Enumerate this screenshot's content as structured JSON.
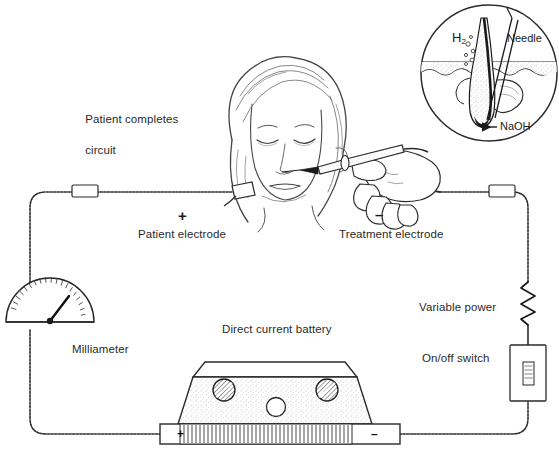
{
  "figure": {
    "background_color": "#ffffff",
    "line_color": "#1a1a1a",
    "text_color": "#2a2a2a"
  },
  "labels": {
    "patient_completes_circuit_line1": "Patient completes",
    "patient_completes_circuit_line2": "circuit",
    "patient_electrode": "Patient electrode",
    "patient_electrode_polarity": "+",
    "treatment_electrode": "Treatment electrode",
    "treatment_electrode_polarity": "–",
    "milliameter": "Milliameter",
    "direct_current_battery": "Direct current battery",
    "variable_power": "Variable power",
    "on_off_switch": "On/off switch"
  },
  "battery": {
    "positive_terminal": "+",
    "negative_terminal": "–"
  },
  "inset": {
    "hydrogen_label": "H",
    "hydrogen_subscript": "2",
    "needle_label": "Needle",
    "naoh_label": "NaOH"
  }
}
